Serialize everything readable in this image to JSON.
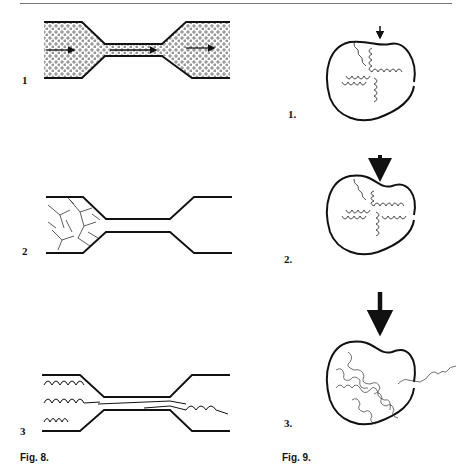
{
  "page": {
    "figure8": {
      "caption": "Fig. 8.",
      "panels": [
        {
          "label": "1",
          "description": "Channel with contraction; suspended particles flowing with arrows"
        },
        {
          "label": "2",
          "description": "Channel with branched polymer network blocked at contraction"
        },
        {
          "label": "3",
          "description": "Coiled chains uncoiling and stretching through contraction"
        }
      ]
    },
    "figure9": {
      "caption": "Fig. 9.",
      "panels": [
        {
          "label": "1.",
          "description": "Globule with helical chains, small arrow pressing"
        },
        {
          "label": "2.",
          "description": "Globule deformed, medium arrow pressing"
        },
        {
          "label": "3.",
          "description": "Globule ruptured, large arrow, chains unwinding outward"
        }
      ]
    }
  }
}
